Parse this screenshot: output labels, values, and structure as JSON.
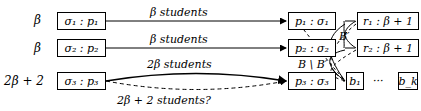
{
  "rows": [
    {
      "weight": "β",
      "source": "σ₁ : p₁",
      "target": "p₁ : σ₁",
      "edge_label": "β students"
    },
    {
      "weight": "β",
      "source": "σ₂ : p₂",
      "target": "p₂ : σ₂",
      "edge_label": "β students"
    },
    {
      "weight": "2β + 2",
      "source": "σ₃ : p₃",
      "target": "p₃ : σ₃",
      "edge_label": "2β students",
      "dashed_label": "2β + 2 students?"
    }
  ],
  "right_nodes": {
    "r1": "r₁ : β + 1",
    "r2": "r₂ : β + 1",
    "b1": "b₁",
    "ellipsis": "···",
    "bk": "b_k"
  },
  "edge_labels": {
    "b_prime": "B′",
    "b_minus": "B \\ B′"
  }
}
